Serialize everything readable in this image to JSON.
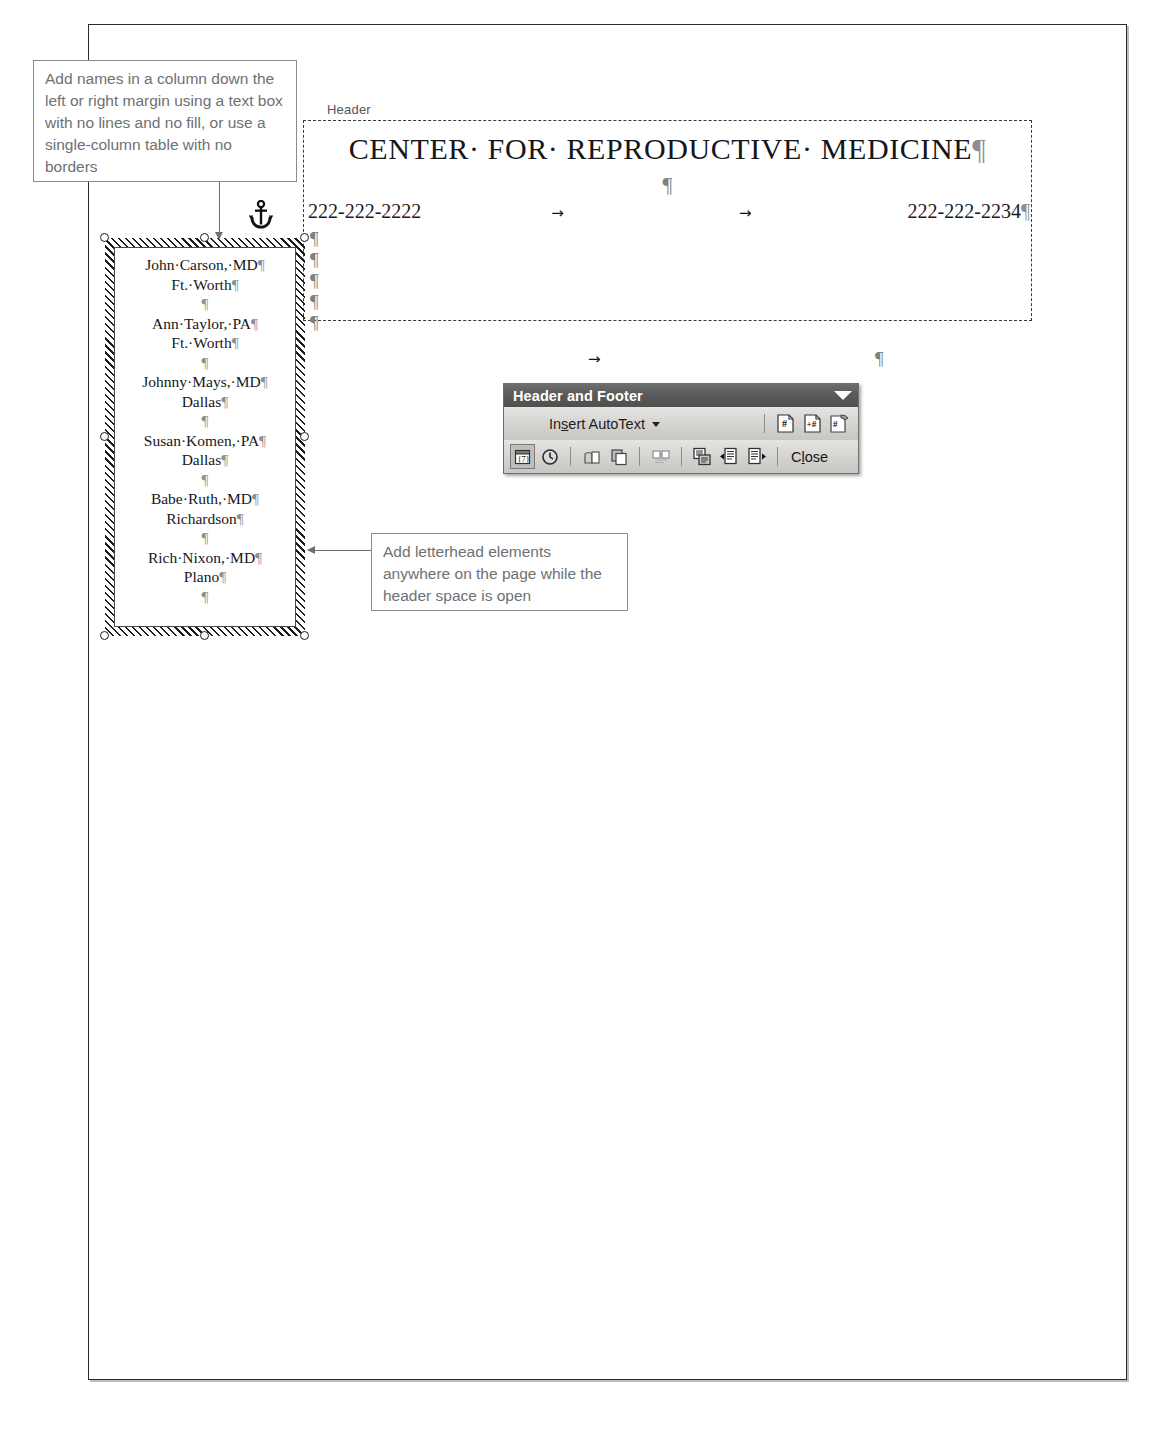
{
  "callouts": [
    {
      "id": "names",
      "text": "Add names in a column down the left or right margin using a text box with no lines and no fill, or use a single-column table with no borders"
    },
    {
      "id": "letterhead",
      "text": "Add letterhead elements anywhere on the page while the header space is open"
    }
  ],
  "header": {
    "label": "Header",
    "title": "CENTER· FOR· REPRODUCTIVE· MEDICINE",
    "title_pilcrow": "¶",
    "blank_line_pilcrow": "¶",
    "phone_left": "222-222-2222",
    "phone_right": "222-222-2234",
    "phone_right_pilcrow": "¶",
    "tab_mark": "→",
    "pilcrow_column": [
      "¶",
      "¶",
      "¶",
      "¶",
      "¶"
    ]
  },
  "below_header": {
    "tab_mark": "→",
    "pilcrow": "¶"
  },
  "names_textbox": {
    "entries": [
      {
        "name": "John·Carson,·MD",
        "city": "Ft.·Worth"
      },
      {
        "name": "Ann·Taylor,·PA",
        "city": "Ft.·Worth"
      },
      {
        "name": "Johnny·Mays,·MD",
        "city": "Dallas"
      },
      {
        "name": "Susan·Komen,·PA",
        "city": "Dallas"
      },
      {
        "name": "Babe·Ruth,·MD",
        "city": "Richardson"
      },
      {
        "name": "Rich·Nixon,·MD",
        "city": "Plano"
      }
    ],
    "pilcrow": "¶",
    "blank_pilcrow": "¶"
  },
  "icons": {
    "anchor": "anchor-icon",
    "caret_down": "▼"
  },
  "toolbar": {
    "title": "Header and Footer",
    "autotext_label_pre": "In",
    "autotext_label_accel": "s",
    "autotext_label_post": "ert AutoText",
    "close_pre": "C",
    "close_accel": "l",
    "close_post": "ose",
    "buttons_row1": [
      {
        "name": "insert-page-number-button",
        "glyph": "#"
      },
      {
        "name": "insert-number-of-pages-button",
        "glyph": "+#"
      },
      {
        "name": "format-page-number-button",
        "glyph": "#"
      }
    ],
    "buttons_row2": [
      {
        "name": "insert-date-button",
        "glyph": "7"
      },
      {
        "name": "insert-time-button",
        "glyph": "clock"
      },
      {
        "name": "page-setup-button",
        "glyph": "page"
      },
      {
        "name": "show-hide-document-text-button",
        "glyph": "copy"
      },
      {
        "name": "same-as-previous-button",
        "glyph": "link"
      },
      {
        "name": "switch-header-footer-button",
        "glyph": "switch"
      },
      {
        "name": "show-previous-button",
        "glyph": "prev"
      },
      {
        "name": "show-next-button",
        "glyph": "next"
      }
    ]
  },
  "colors": {
    "titlebar": "#5a5a5a",
    "toolbar_face": "#d7d5d2",
    "callout_text": "#6d7173",
    "page_border": "#2b2b2b"
  }
}
